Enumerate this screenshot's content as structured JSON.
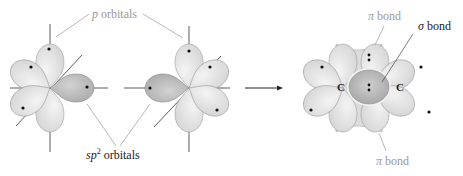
{
  "diagram": {
    "type": "orbital-overlap",
    "labels": {
      "p_orbitals": {
        "symbol": "p",
        "text": "orbitals"
      },
      "sp2_orbitals": {
        "symbol": "sp",
        "superscript": "2",
        "text": "orbitals"
      },
      "pi_bond_top": {
        "symbol": "π",
        "text": "bond"
      },
      "pi_bond_bottom": {
        "symbol": "π",
        "text": "bond"
      },
      "sigma_bond": {
        "symbol": "σ",
        "text": "bond"
      },
      "carbon_left": "C",
      "carbon_right": "C"
    },
    "colors": {
      "lobe_light": "#e4e4e4",
      "lobe_edge": "#9c9c9c",
      "sp2_lobe": "#bdbdbd",
      "sigma_overlap": "#b8b8b8",
      "label_gray": "#9a9a9a",
      "label_dark": "#222222"
    },
    "arrow": {
      "direction": "right"
    }
  }
}
